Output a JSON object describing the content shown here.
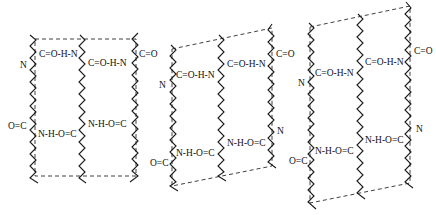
{
  "diagram": {
    "title": "",
    "colors": {
      "ink": "#1a1a1a",
      "background": "#ffffff"
    },
    "panels": [
      {
        "id": "panel-1",
        "labels": {
          "top_hbond_1": "C=O-H-N",
          "top_hbond_2": "C=O-H-N",
          "top_left_n": "N",
          "top_right_co": "C=O",
          "bottom_left_oc": "O=C",
          "bottom_hbond_1": "N-H-O=C",
          "bottom_hbond_2": "N-H-O=C"
        }
      },
      {
        "id": "panel-2",
        "labels": {
          "top_hbond_1": "C=O-H-N",
          "top_hbond_2": "C=O-H-N",
          "top_left_n": "N",
          "top_right_co": "C=O",
          "bottom_left_oc": "O=C",
          "bottom_hbond_1": "N-H-O=C",
          "bottom_hbond_2": "N-H-O=C",
          "bottom_right_n": "N"
        }
      },
      {
        "id": "panel-3",
        "labels": {
          "top_hbond_1": "C=O-H-N",
          "top_hbond_2": "C=O-H-N",
          "top_left_n": "N",
          "top_right_co": "C=O",
          "bottom_left_oc": "O=C",
          "bottom_hbond_1": "N-H-O=C",
          "bottom_hbond_2": "N-H-O=C",
          "bottom_right_n": "N"
        }
      }
    ]
  }
}
